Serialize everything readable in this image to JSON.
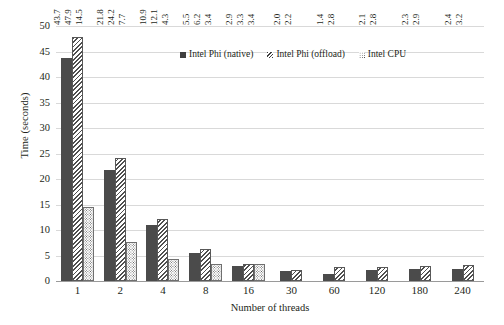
{
  "chart_data": {
    "type": "bar",
    "title": "",
    "xlabel": "Number of threads",
    "ylabel": "Time (seconds)",
    "ylim": [
      0,
      50
    ],
    "ytick_step": 5,
    "yticks": [
      "0",
      "5",
      "10",
      "15",
      "20",
      "25",
      "30",
      "35",
      "40",
      "45",
      "50"
    ],
    "grid": true,
    "legend_position": "top-center-inside",
    "categories": [
      "1",
      "2",
      "4",
      "8",
      "16",
      "30",
      "60",
      "120",
      "180",
      "240"
    ],
    "series": [
      {
        "name": "Intel Phi (native)",
        "pattern": "solid",
        "color": "#4b4b4b",
        "values": [
          43.7,
          21.8,
          10.9,
          5.5,
          2.9,
          2.0,
          1.4,
          2.1,
          2.3,
          2.4
        ],
        "labels": [
          "43.7",
          "21.8",
          "10.9",
          "5.5",
          "2.9",
          "2.0",
          "1.4",
          "2.1",
          "2.3",
          "2.4"
        ]
      },
      {
        "name": "Intel Phi (offload)",
        "pattern": "diagonal-hatch",
        "color": "#4f4f4f",
        "values": [
          47.9,
          24.2,
          12.1,
          6.2,
          3.3,
          2.2,
          2.8,
          2.8,
          2.9,
          3.2
        ],
        "labels": [
          "47.9",
          "24.2",
          "12.1",
          "6.2",
          "3.3",
          "2.2",
          "2.8",
          "2.8",
          "2.9",
          "3.2"
        ]
      },
      {
        "name": "Intel CPU",
        "pattern": "dotted",
        "color": "#5e5e5e",
        "values": [
          14.5,
          7.7,
          4.3,
          3.4,
          3.4,
          null,
          null,
          null,
          null,
          null
        ],
        "labels": [
          "14.5",
          "7.7",
          "4.3",
          "3.4",
          "3.4",
          "",
          "",
          "",
          "",
          ""
        ]
      }
    ]
  },
  "legend": {
    "items": [
      {
        "label": "Intel Phi (native)"
      },
      {
        "label": "Intel Phi (offload)"
      },
      {
        "label": "Intel CPU"
      }
    ]
  }
}
